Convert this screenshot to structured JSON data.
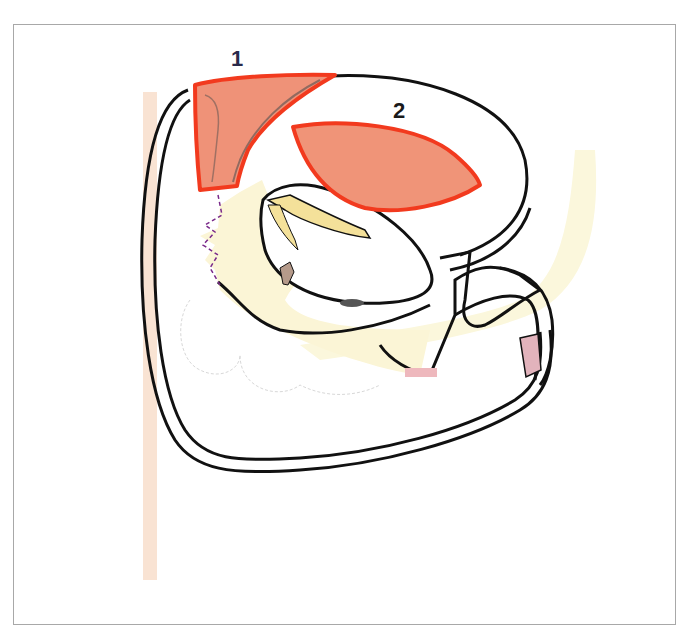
{
  "figure": {
    "type": "anatomical-sagittal-section",
    "labels": [
      {
        "id": "1",
        "text": "1",
        "color": "#2a2a4a"
      },
      {
        "id": "2",
        "text": "2",
        "color": "#1a1a1a"
      }
    ],
    "regions": [
      {
        "label": "1",
        "fill": "#ef9278",
        "stroke": "#f23a1e"
      },
      {
        "label": "2",
        "fill": "#f09478",
        "stroke": "#f23a1e"
      }
    ],
    "colors": {
      "outline": "#111111",
      "tissue_yellow": "#fbf6d8",
      "tissue_yellow_strong": "#f6e7a8",
      "highlight_pink": "#e2b3bc",
      "spine_band": "#f7d9c4",
      "frame_border": "#a8a8a8"
    }
  }
}
